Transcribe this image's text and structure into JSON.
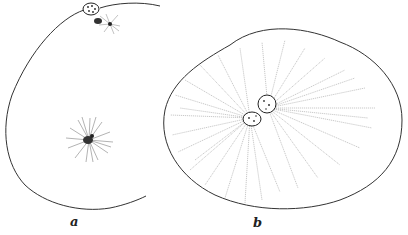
{
  "figure": {
    "panels": [
      {
        "id": "a",
        "label": "a",
        "description": "Egg cell outline with polar body at top and a small aster at center",
        "elements": [
          "cell-outline",
          "polar-body",
          "small-aster-top",
          "central-aster"
        ]
      },
      {
        "id": "b",
        "label": "b",
        "description": "Egg cell with two pronuclei in contact surrounded by a large radiating aster",
        "elements": [
          "cell-outline",
          "pronucleus-1",
          "pronucleus-2",
          "large-aster"
        ]
      }
    ],
    "colors": {
      "ink": "#333333",
      "background": "#ffffff"
    }
  }
}
